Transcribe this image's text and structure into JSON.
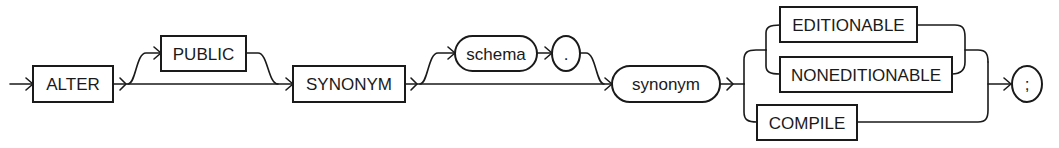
{
  "diagram": {
    "type": "railroad-syntax",
    "statement": "ALTER SYNONYM",
    "nodes": {
      "alter": {
        "label": "ALTER",
        "kind": "keyword"
      },
      "public": {
        "label": "PUBLIC",
        "kind": "keyword",
        "optional": true
      },
      "synonym_kw": {
        "label": "SYNONYM",
        "kind": "keyword"
      },
      "schema": {
        "label": "schema",
        "kind": "identifier",
        "optional": true
      },
      "dot": {
        "label": ".",
        "kind": "punctuation",
        "optional": true
      },
      "synonym": {
        "label": "synonym",
        "kind": "identifier"
      },
      "editionable": {
        "label": "EDITIONABLE",
        "kind": "keyword",
        "choice_group": "action"
      },
      "noneditionable": {
        "label": "NONEDITIONABLE",
        "kind": "keyword",
        "choice_group": "action"
      },
      "compile": {
        "label": "COMPILE",
        "kind": "keyword",
        "choice_group": "action"
      },
      "semicolon": {
        "label": ";",
        "kind": "punctuation"
      }
    },
    "colors": {
      "stroke": "#1a1a1a",
      "background": "#ffffff"
    }
  }
}
